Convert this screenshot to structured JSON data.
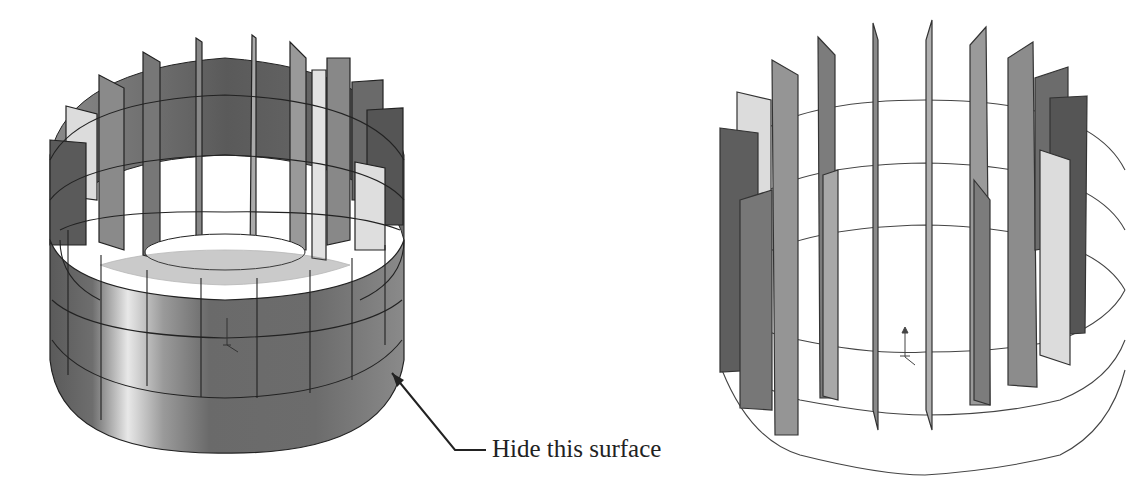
{
  "figure": {
    "left_view": {
      "description": "Shaded cylinder with radial fin surfaces (outer cylindrical surface visible)",
      "fin_count_visible": 16,
      "colors": {
        "dark": "#555555",
        "mid": "#7a7a7a",
        "light": "#d6d6d6",
        "highlight": "#efefef",
        "edge": "#222222"
      }
    },
    "right_view": {
      "description": "Same model with outer cylindrical surface hidden; fins and circular sketch edges visible",
      "fin_count_visible": 16,
      "colors": {
        "dark": "#5c5c5c",
        "mid": "#8c8c8c",
        "light": "#d8d8d8",
        "edge": "#333333"
      }
    },
    "callout": {
      "label": "Hide this surface"
    }
  }
}
